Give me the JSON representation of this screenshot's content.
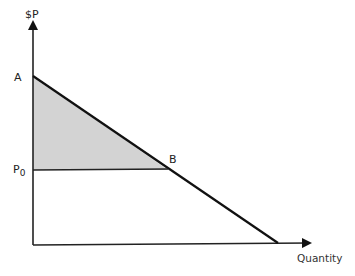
{
  "diagram": {
    "title": "",
    "y_axis_label": "$P",
    "x_axis_label": "Quantity",
    "points": {
      "A": {
        "label": "A"
      },
      "B": {
        "label": "B"
      },
      "P0": {
        "label": "P",
        "subscript": "0"
      }
    },
    "shaded_region": "triangle A-B-P0 (consumer surplus)",
    "colors": {
      "line": "#111111",
      "shade": "#d3d3d3",
      "axis": "#222222"
    }
  }
}
